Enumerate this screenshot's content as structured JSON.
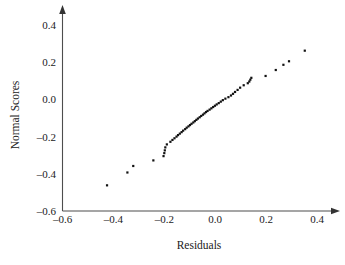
{
  "chart_data": {
    "type": "scatter",
    "title": "",
    "xlabel": "Residuals",
    "ylabel": "Normal Scores",
    "xlim": [
      -0.6,
      0.45
    ],
    "ylim": [
      -0.6,
      0.45
    ],
    "xticks": [
      -0.6,
      -0.4,
      -0.2,
      0.0,
      0.2,
      0.4
    ],
    "yticks": [
      -0.6,
      -0.4,
      -0.2,
      0.0,
      0.2,
      0.4
    ],
    "xticklabels": [
      "–0.6",
      "–0.4",
      "–0.2",
      "0.0",
      "0.2",
      "0.4"
    ],
    "yticklabels": [
      "–0.6",
      "–0.4",
      "–0.2",
      "0.0",
      "0.2",
      "0.4"
    ],
    "grid": false,
    "legend": null,
    "marker": "square",
    "marker_color": "#111111",
    "marker_size": 2.2,
    "points": [
      [
        -0.425,
        -0.462
      ],
      [
        -0.345,
        -0.393
      ],
      [
        -0.322,
        -0.358
      ],
      [
        -0.243,
        -0.328
      ],
      [
        -0.203,
        -0.305
      ],
      [
        -0.2,
        -0.289
      ],
      [
        -0.198,
        -0.274
      ],
      [
        -0.196,
        -0.258
      ],
      [
        -0.19,
        -0.242
      ],
      [
        -0.176,
        -0.228
      ],
      [
        -0.168,
        -0.218
      ],
      [
        -0.16,
        -0.209
      ],
      [
        -0.152,
        -0.2
      ],
      [
        -0.146,
        -0.192
      ],
      [
        -0.139,
        -0.184
      ],
      [
        -0.132,
        -0.176
      ],
      [
        -0.126,
        -0.168
      ],
      [
        -0.118,
        -0.16
      ],
      [
        -0.112,
        -0.152
      ],
      [
        -0.105,
        -0.145
      ],
      [
        -0.099,
        -0.138
      ],
      [
        -0.093,
        -0.131
      ],
      [
        -0.086,
        -0.124
      ],
      [
        -0.08,
        -0.117
      ],
      [
        -0.074,
        -0.11
      ],
      [
        -0.068,
        -0.103
      ],
      [
        -0.061,
        -0.096
      ],
      [
        -0.055,
        -0.089
      ],
      [
        -0.048,
        -0.082
      ],
      [
        -0.042,
        -0.075
      ],
      [
        -0.036,
        -0.068
      ],
      [
        -0.03,
        -0.062
      ],
      [
        -0.022,
        -0.055
      ],
      [
        -0.015,
        -0.048
      ],
      [
        -0.008,
        -0.041
      ],
      [
        -0.001,
        -0.034
      ],
      [
        0.006,
        -0.027
      ],
      [
        0.014,
        -0.02
      ],
      [
        0.022,
        -0.012
      ],
      [
        0.03,
        -0.004
      ],
      [
        0.04,
        0.004
      ],
      [
        0.052,
        0.012
      ],
      [
        0.062,
        0.021
      ],
      [
        0.07,
        0.03
      ],
      [
        0.078,
        0.04
      ],
      [
        0.088,
        0.051
      ],
      [
        0.098,
        0.063
      ],
      [
        0.112,
        0.076
      ],
      [
        0.128,
        0.087
      ],
      [
        0.134,
        0.096
      ],
      [
        0.138,
        0.106
      ],
      [
        0.142,
        0.116
      ],
      [
        0.198,
        0.126
      ],
      [
        0.238,
        0.158
      ],
      [
        0.268,
        0.186
      ],
      [
        0.29,
        0.205
      ],
      [
        0.352,
        0.262
      ]
    ]
  },
  "axes": {
    "x_axis_name": "x-axis",
    "y_axis_name": "y-axis"
  }
}
